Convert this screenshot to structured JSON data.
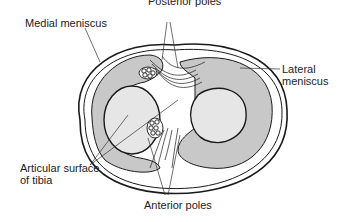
{
  "figure": {
    "labels": {
      "posterior_poles": "Posterior poles",
      "medial_meniscus": "Medial meniscus",
      "lateral_meniscus_line1": "Lateral",
      "lateral_meniscus_line2": "meniscus",
      "articular_surface_line1": "Articular surface",
      "articular_surface_line2": "of tibia",
      "anterior_poles": "Anterior poles"
    },
    "colors": {
      "meniscus_fill": "#c8c8c8",
      "articular_fill": "#e6e6e6",
      "outline": "#1a1a1a",
      "leader_line": "#333333"
    }
  }
}
